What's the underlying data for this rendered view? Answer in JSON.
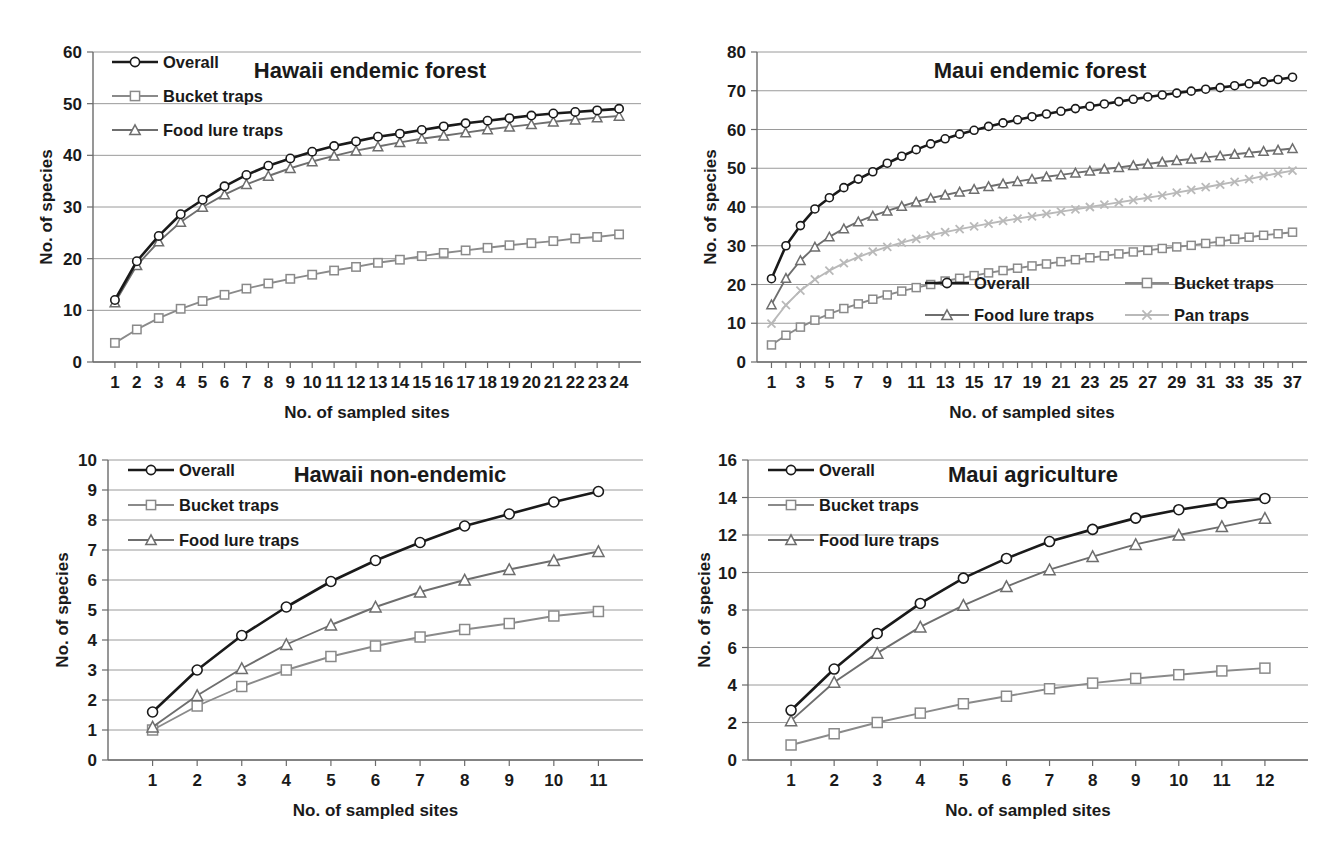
{
  "figure": {
    "panel_count": 4,
    "shared_xlabel": "No. of sampled sites",
    "shared_ylabel": "No. of species"
  },
  "colors": {
    "overall": "#1a1a1a",
    "bucket_traps": "#8a8a8a",
    "food_lure_traps": "#6e6e6e",
    "pan_traps": "#b9b9b9",
    "gridline": "#9a9a9a",
    "axis": "#6b6b6b",
    "text": "#1a1a1a",
    "background": "#ffffff"
  },
  "chart_data": [
    {
      "id": "hawaii-endemic-forest",
      "type": "line",
      "title": "Hawaii endemic forest",
      "xlabel": "No. of sampled sites",
      "ylabel": "No. of species",
      "xlim": [
        0,
        25
      ],
      "ylim": [
        0,
        60
      ],
      "yticks": [
        0,
        10,
        20,
        30,
        40,
        50,
        60
      ],
      "xticks": [
        1,
        2,
        3,
        4,
        5,
        6,
        7,
        8,
        9,
        10,
        11,
        12,
        13,
        14,
        15,
        16,
        17,
        18,
        19,
        20,
        21,
        22,
        23,
        24
      ],
      "grid": true,
      "legend_position": "top-left",
      "x": [
        1,
        2,
        3,
        4,
        5,
        6,
        7,
        8,
        9,
        10,
        11,
        12,
        13,
        14,
        15,
        16,
        17,
        18,
        19,
        20,
        21,
        22,
        23,
        24
      ],
      "series": [
        {
          "name": "Overall",
          "marker": "circle",
          "color": "#1a1a1a",
          "values": [
            12.0,
            19.5,
            24.4,
            28.6,
            31.4,
            34.0,
            36.2,
            38.0,
            39.4,
            40.7,
            41.8,
            42.7,
            43.6,
            44.2,
            44.9,
            45.6,
            46.2,
            46.7,
            47.2,
            47.7,
            48.1,
            48.4,
            48.7,
            49.0
          ]
        },
        {
          "name": "Bucket traps",
          "marker": "square",
          "color": "#8a8a8a",
          "values": [
            3.7,
            6.3,
            8.5,
            10.3,
            11.8,
            13.0,
            14.2,
            15.2,
            16.1,
            16.9,
            17.7,
            18.4,
            19.2,
            19.8,
            20.5,
            21.1,
            21.6,
            22.1,
            22.6,
            23.0,
            23.4,
            23.9,
            24.2,
            24.7
          ]
        },
        {
          "name": "Food lure traps",
          "marker": "triangle",
          "color": "#6e6e6e",
          "values": [
            11.5,
            18.7,
            23.3,
            27.1,
            30.0,
            32.4,
            34.4,
            36.0,
            37.5,
            38.8,
            39.9,
            40.9,
            41.7,
            42.5,
            43.2,
            43.8,
            44.4,
            45.0,
            45.5,
            46.0,
            46.5,
            46.9,
            47.3,
            47.6
          ]
        }
      ]
    },
    {
      "id": "maui-endemic-forest",
      "type": "line",
      "title": "Maui endemic forest",
      "xlabel": "No. of sampled sites",
      "ylabel": "No. of species",
      "xlim": [
        0,
        38
      ],
      "ylim": [
        0,
        80
      ],
      "yticks": [
        0,
        10,
        20,
        30,
        40,
        50,
        60,
        70,
        80
      ],
      "xticks": [
        1,
        3,
        5,
        7,
        9,
        11,
        13,
        15,
        17,
        19,
        21,
        23,
        25,
        27,
        29,
        31,
        33,
        35,
        37
      ],
      "grid": true,
      "legend_position": "bottom-right",
      "x": [
        1,
        2,
        3,
        4,
        5,
        6,
        7,
        8,
        9,
        10,
        11,
        12,
        13,
        14,
        15,
        16,
        17,
        18,
        19,
        20,
        21,
        22,
        23,
        24,
        25,
        26,
        27,
        28,
        29,
        30,
        31,
        32,
        33,
        34,
        35,
        36,
        37
      ],
      "series": [
        {
          "name": "Overall",
          "marker": "circle",
          "color": "#1a1a1a",
          "values": [
            21.5,
            30.0,
            35.2,
            39.5,
            42.4,
            45.0,
            47.2,
            49.1,
            51.3,
            53.1,
            54.8,
            56.3,
            57.6,
            58.8,
            59.8,
            60.8,
            61.7,
            62.5,
            63.3,
            64.0,
            64.7,
            65.4,
            66.0,
            66.6,
            67.2,
            67.8,
            68.4,
            68.9,
            69.4,
            69.9,
            70.4,
            70.8,
            71.3,
            71.8,
            72.3,
            72.9,
            73.5
          ]
        },
        {
          "name": "Bucket traps",
          "marker": "square",
          "color": "#8a8a8a",
          "values": [
            4.4,
            6.9,
            9.0,
            10.8,
            12.4,
            13.8,
            15.0,
            16.2,
            17.3,
            18.3,
            19.2,
            20.0,
            20.9,
            21.6,
            22.3,
            23.0,
            23.6,
            24.2,
            24.8,
            25.3,
            25.9,
            26.4,
            26.9,
            27.4,
            27.9,
            28.4,
            28.8,
            29.3,
            29.7,
            30.1,
            30.6,
            31.1,
            31.7,
            32.2,
            32.7,
            33.1,
            33.5
          ]
        },
        {
          "name": "Food lure traps",
          "marker": "triangle",
          "color": "#6e6e6e",
          "values": [
            14.8,
            21.6,
            26.2,
            29.7,
            32.3,
            34.4,
            36.2,
            37.7,
            39.0,
            40.2,
            41.3,
            42.3,
            43.1,
            43.9,
            44.6,
            45.3,
            46.0,
            46.6,
            47.2,
            47.8,
            48.3,
            48.8,
            49.3,
            49.8,
            50.2,
            50.7,
            51.1,
            51.6,
            52.0,
            52.4,
            52.8,
            53.2,
            53.6,
            54.0,
            54.4,
            54.7,
            55.1
          ]
        },
        {
          "name": "Pan traps",
          "marker": "cross",
          "color": "#b9b9b9",
          "values": [
            9.9,
            14.7,
            18.4,
            21.3,
            23.6,
            25.5,
            27.1,
            28.5,
            29.7,
            30.8,
            31.8,
            32.7,
            33.5,
            34.3,
            35.0,
            35.7,
            36.4,
            37.0,
            37.6,
            38.2,
            38.8,
            39.4,
            40.0,
            40.6,
            41.2,
            41.8,
            42.4,
            43.0,
            43.7,
            44.4,
            45.1,
            45.8,
            46.5,
            47.2,
            48.0,
            48.7,
            49.4
          ]
        }
      ]
    },
    {
      "id": "hawaii-non-endemic",
      "type": "line",
      "title": "Hawaii non-endemic",
      "xlabel": "No. of sampled sites",
      "ylabel": "No. of species",
      "xlim": [
        0,
        12
      ],
      "ylim": [
        0,
        10
      ],
      "yticks": [
        0,
        1,
        2,
        3,
        4,
        5,
        6,
        7,
        8,
        9,
        10
      ],
      "xticks": [
        1,
        2,
        3,
        4,
        5,
        6,
        7,
        8,
        9,
        10,
        11
      ],
      "grid": true,
      "legend_position": "top-left",
      "x": [
        1,
        2,
        3,
        4,
        5,
        6,
        7,
        8,
        9,
        10,
        11
      ],
      "series": [
        {
          "name": "Overall",
          "marker": "circle",
          "color": "#1a1a1a",
          "values": [
            1.6,
            3.0,
            4.15,
            5.1,
            5.95,
            6.65,
            7.25,
            7.8,
            8.2,
            8.6,
            8.95
          ]
        },
        {
          "name": "Bucket traps",
          "marker": "square",
          "color": "#8a8a8a",
          "values": [
            1.0,
            1.8,
            2.45,
            3.0,
            3.45,
            3.8,
            4.1,
            4.35,
            4.55,
            4.8,
            4.95
          ]
        },
        {
          "name": "Food lure traps",
          "marker": "triangle",
          "color": "#6e6e6e",
          "values": [
            1.1,
            2.15,
            3.05,
            3.85,
            4.5,
            5.1,
            5.6,
            6.0,
            6.35,
            6.65,
            6.95
          ]
        }
      ]
    },
    {
      "id": "maui-agriculture",
      "type": "line",
      "title": "Maui agriculture",
      "xlabel": "No. of sampled sites",
      "ylabel": "No. of species",
      "xlim": [
        0,
        13
      ],
      "ylim": [
        0,
        16
      ],
      "yticks": [
        0,
        2,
        4,
        6,
        8,
        10,
        12,
        14,
        16
      ],
      "xticks": [
        1,
        2,
        3,
        4,
        5,
        6,
        7,
        8,
        9,
        10,
        11,
        12
      ],
      "grid": true,
      "legend_position": "top-left",
      "x": [
        1,
        2,
        3,
        4,
        5,
        6,
        7,
        8,
        9,
        10,
        11,
        12
      ],
      "series": [
        {
          "name": "Overall",
          "marker": "circle",
          "color": "#1a1a1a",
          "values": [
            2.65,
            4.85,
            6.75,
            8.35,
            9.7,
            10.75,
            11.65,
            12.3,
            12.9,
            13.35,
            13.7,
            13.95
          ]
        },
        {
          "name": "Bucket traps",
          "marker": "square",
          "color": "#8a8a8a",
          "values": [
            0.8,
            1.4,
            2.0,
            2.5,
            3.0,
            3.4,
            3.8,
            4.1,
            4.35,
            4.55,
            4.75,
            4.9
          ]
        },
        {
          "name": "Food lure traps",
          "marker": "triangle",
          "color": "#6e6e6e",
          "values": [
            2.1,
            4.15,
            5.7,
            7.1,
            8.25,
            9.25,
            10.15,
            10.85,
            11.5,
            12.0,
            12.45,
            12.9
          ]
        }
      ]
    }
  ]
}
